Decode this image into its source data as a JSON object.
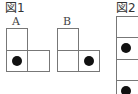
{
  "figure1": {
    "title": "図1",
    "A": {
      "label": "A"
    },
    "B": {
      "label": "B"
    }
  },
  "figure2": {
    "title": "図2"
  },
  "colors": {
    "line": "#777777",
    "dot": "#111111"
  }
}
